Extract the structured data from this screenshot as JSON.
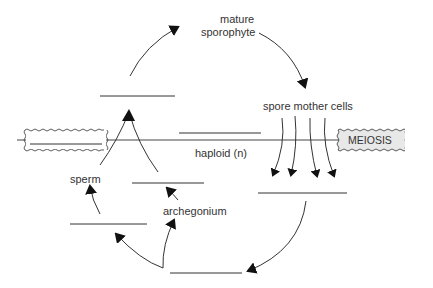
{
  "diagram": {
    "labels": {
      "mature_sporophyte_line1": "mature",
      "mature_sporophyte_line2": "sporophyte",
      "spore_mother_cells": "spore mother cells",
      "meiosis": "MEIOSIS",
      "haploid": "haploid (n)",
      "sperm": "sperm",
      "archegonium": "archegonium"
    },
    "blanks": [
      {
        "id": "blank-above-fertilization",
        "x1": 100,
        "x2": 175,
        "y": 96
      },
      {
        "id": "blank-diploid-middle",
        "x1": 179,
        "x2": 261,
        "y": 132
      },
      {
        "id": "blank-egg",
        "x1": 132,
        "x2": 204,
        "y": 183
      },
      {
        "id": "blank-spores",
        "x1": 258,
        "x2": 347,
        "y": 193
      },
      {
        "id": "blank-male-gametophyte",
        "x1": 70,
        "x2": 147,
        "y": 224
      },
      {
        "id": "blank-bottom",
        "x1": 170,
        "x2": 242,
        "y": 273
      },
      {
        "id": "blank-zygote-box",
        "x1": 30,
        "x2": 102,
        "y": 143
      }
    ],
    "colors": {
      "line": "#333333",
      "meiosis_fill": "#e8e8e8",
      "background": "#ffffff"
    }
  }
}
